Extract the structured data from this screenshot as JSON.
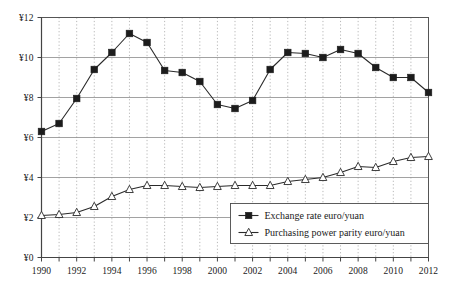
{
  "chart_data": {
    "type": "line",
    "title": "",
    "subtitle": "",
    "xlabel": "",
    "ylabel": "",
    "xlim": [
      1990,
      2012
    ],
    "ylim": [
      0,
      12
    ],
    "grid": true,
    "legend_position": "bottom-right",
    "currency_symbol": "¥",
    "x": [
      1990,
      1991,
      1992,
      1993,
      1994,
      1995,
      1996,
      1997,
      1998,
      1999,
      2000,
      2001,
      2002,
      2003,
      2004,
      2005,
      2006,
      2007,
      2008,
      2009,
      2010,
      2011,
      2012
    ],
    "x_tick_labels": [
      "1990",
      "1992",
      "1994",
      "1996",
      "1998",
      "2000",
      "2002",
      "2004",
      "2006",
      "2008",
      "2010",
      "2012"
    ],
    "x_tick_values": [
      1990,
      1992,
      1994,
      1996,
      1998,
      2000,
      2002,
      2004,
      2006,
      2008,
      2010,
      2012
    ],
    "y_tick_labels": [
      "¥0",
      "¥2",
      "¥4",
      "¥6",
      "¥8",
      "¥10",
      "¥12"
    ],
    "y_tick_values": [
      0,
      2,
      4,
      6,
      8,
      10,
      12
    ],
    "series": [
      {
        "name": "Exchange rate euro/yuan",
        "marker": "filled-square",
        "color": "#1c1c1c",
        "values": [
          6.3,
          6.7,
          7.95,
          9.4,
          10.25,
          11.2,
          10.75,
          9.35,
          9.25,
          8.8,
          7.65,
          7.45,
          7.85,
          9.4,
          10.25,
          10.2,
          10.0,
          10.4,
          10.2,
          9.5,
          9.0,
          9.0,
          8.25
        ]
      },
      {
        "name": "Purchasing power parity euro/yuan",
        "marker": "open-triangle",
        "color": "#2a2a2a",
        "values": [
          2.1,
          2.15,
          2.25,
          2.55,
          3.05,
          3.4,
          3.6,
          3.6,
          3.55,
          3.5,
          3.55,
          3.6,
          3.6,
          3.6,
          3.8,
          3.9,
          4.0,
          4.25,
          4.55,
          4.5,
          4.8,
          5.0,
          5.05
        ]
      }
    ]
  },
  "legend": {
    "entries": [
      {
        "label": "Exchange rate euro/yuan",
        "marker": "filled-square"
      },
      {
        "label": "Purchasing power parity euro/yuan",
        "marker": "open-triangle"
      }
    ]
  }
}
